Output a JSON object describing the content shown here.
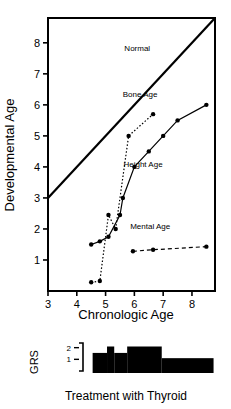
{
  "chart_data": {
    "type": "line",
    "title": "",
    "xlabel": "Chronologic Age",
    "ylabel": "Developmental Age",
    "xlim": [
      3,
      8.8
    ],
    "ylim": [
      0,
      8.8
    ],
    "xticks": [
      3,
      4,
      5,
      6,
      7,
      8
    ],
    "yticks": [
      1,
      2,
      3,
      4,
      5,
      6,
      7,
      8
    ],
    "xtick_labels": [
      "3",
      "4",
      "5",
      "6",
      "7",
      "8"
    ],
    "ytick_labels": [
      "1",
      "2",
      "3",
      "4",
      "5",
      "6",
      "7",
      "8"
    ],
    "grid": false,
    "legend": "inline-annotations",
    "series": [
      {
        "name": "Normal",
        "label": "Normal",
        "style": "solid-reference-line",
        "marker": "none",
        "x": [
          3.0,
          8.8
        ],
        "y": [
          3.0,
          8.8
        ],
        "label_x": 6.1,
        "label_y": 7.75
      },
      {
        "name": "Bone Age",
        "label": "Bone Age",
        "style": "dotted",
        "marker": "filled-circle",
        "x": [
          4.5,
          4.8,
          5.1,
          5.35,
          5.8,
          6.65
        ],
        "y": [
          0.28,
          0.32,
          2.45,
          2.0,
          5.0,
          5.7
        ],
        "label_x": 6.2,
        "label_y": 6.25
      },
      {
        "name": "Height Age",
        "label": "Height Age",
        "style": "solid",
        "marker": "filled-circle",
        "x": [
          4.5,
          4.8,
          5.1,
          5.5,
          5.6,
          6.0,
          6.5,
          7.0,
          7.5,
          8.5
        ],
        "y": [
          1.5,
          1.6,
          1.75,
          2.45,
          3.0,
          4.0,
          4.5,
          5.0,
          5.5,
          6.0
        ],
        "label_x": 6.3,
        "label_y": 4.0
      },
      {
        "name": "Mental Age",
        "label": "Mental Age",
        "style": "dashed",
        "marker": "filled-circle",
        "x": [
          5.95,
          6.65,
          8.5
        ],
        "y": [
          1.28,
          1.33,
          1.43
        ],
        "label_x": 6.55,
        "label_y": 2.0
      }
    ],
    "subplot": {
      "name": "GRS",
      "ylabel": "GRS",
      "caption": "Treatment with Thyroid",
      "yticks": [
        1,
        2
      ],
      "ytick_labels": [
        "1",
        "2"
      ],
      "type": "step-bar",
      "steps": [
        {
          "x_start": 4.55,
          "x_end": 5.05,
          "value": 1.55
        },
        {
          "x_start": 5.05,
          "x_end": 5.3,
          "value": 2.1
        },
        {
          "x_start": 5.3,
          "x_end": 5.75,
          "value": 1.55
        },
        {
          "x_start": 5.75,
          "x_end": 6.95,
          "value": 2.1
        },
        {
          "x_start": 6.95,
          "x_end": 8.75,
          "value": 1.1
        }
      ]
    }
  },
  "colors": {
    "ink": "#000000",
    "background": "#ffffff"
  }
}
